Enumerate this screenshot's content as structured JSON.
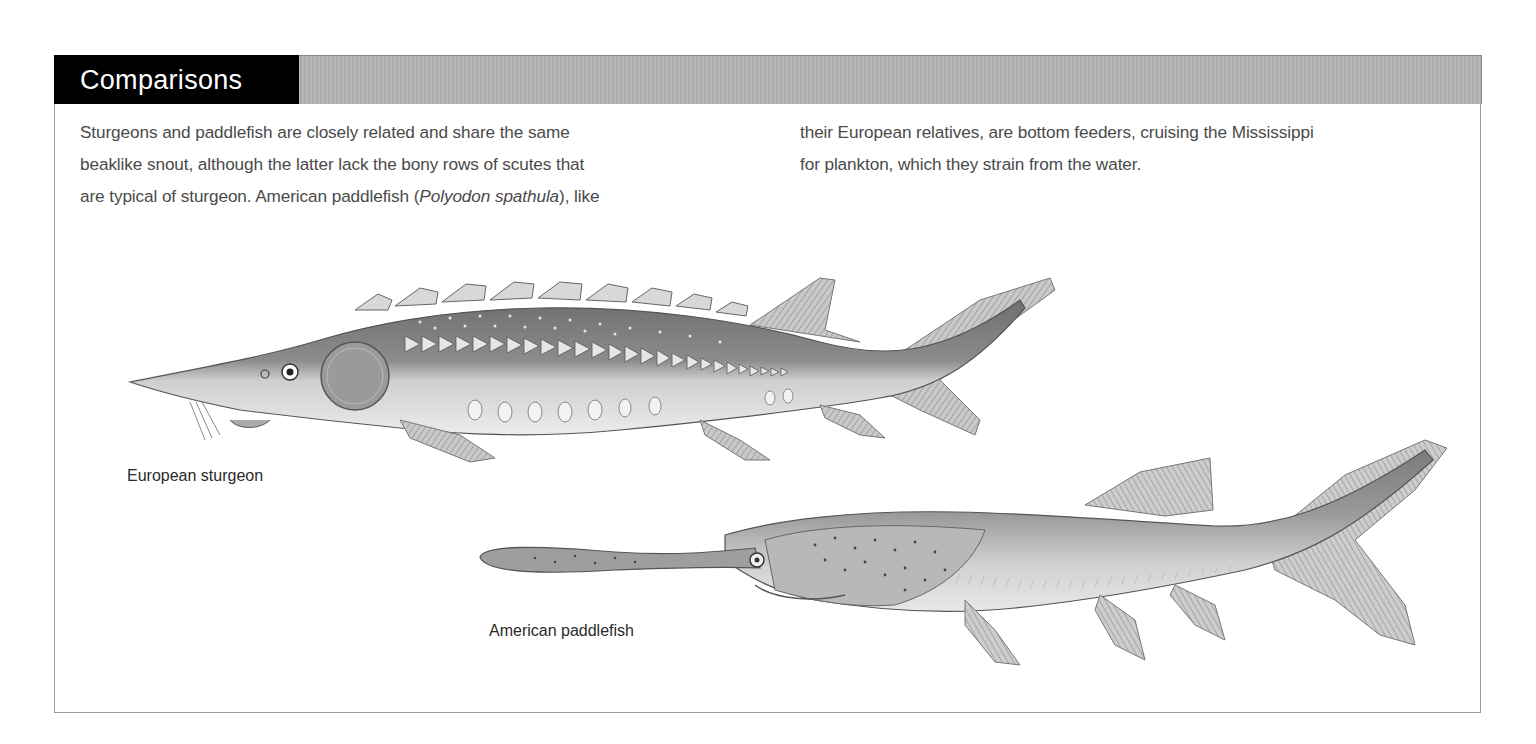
{
  "section": {
    "title": "Comparisons",
    "header_band_color": "#b3b3b3",
    "title_box_color": "#000000"
  },
  "body_text": {
    "left_column": [
      "Sturgeons and paddlefish are closely related and share the same",
      "beaklike snout, although the latter lack the bony rows of scutes that"
    ],
    "left_line3": {
      "before": "are typical of sturgeon. American paddlefish (",
      "italic": "Polyodon spathula",
      "after": "), like"
    },
    "right_column": [
      "their European relatives, are bottom feeders, cruising the Mississippi",
      "for plankton, which they strain from the water."
    ]
  },
  "illustrations": [
    {
      "name": "European sturgeon",
      "label": "European sturgeon"
    },
    {
      "name": "American paddlefish",
      "label": "American paddlefish"
    }
  ]
}
